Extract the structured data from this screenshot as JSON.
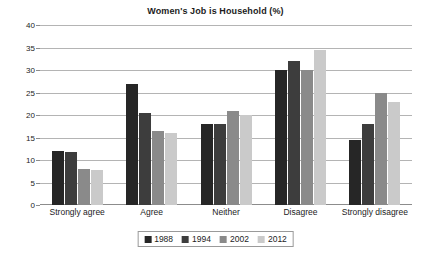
{
  "chart_data": {
    "type": "bar",
    "title": "Women's Job is Household (%)",
    "xlabel": "",
    "ylabel": "",
    "ylim": [
      0,
      40
    ],
    "yticks": [
      0,
      5,
      10,
      15,
      20,
      25,
      30,
      35,
      40
    ],
    "grid": true,
    "legend_position": "bottom",
    "categories": [
      "Strongly agree",
      "Agree",
      "Neither",
      "Disagree",
      "Strongly disagree"
    ],
    "series": [
      {
        "name": "1988",
        "color": "#262626",
        "values": [
          12,
          27,
          18,
          30,
          14.5
        ]
      },
      {
        "name": "1994",
        "color": "#3d3d3d",
        "values": [
          11.8,
          20.5,
          18,
          32,
          18
        ]
      },
      {
        "name": "2002",
        "color": "#8a8a8a",
        "values": [
          8,
          16.5,
          21,
          30,
          25
        ]
      },
      {
        "name": "2012",
        "color": "#cacaca",
        "values": [
          7.8,
          16,
          20,
          34.5,
          23
        ]
      }
    ]
  }
}
